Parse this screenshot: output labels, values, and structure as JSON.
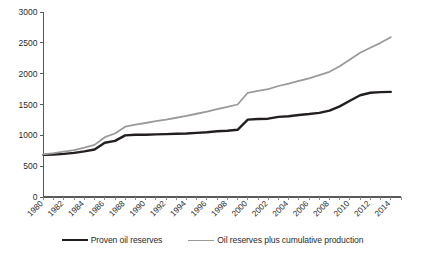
{
  "chart_data": {
    "type": "line",
    "title": "",
    "xlabel": "",
    "ylabel": "",
    "xlim": [
      1980,
      2015
    ],
    "ylim": [
      0,
      3000
    ],
    "grid": false,
    "legend_position": "bottom",
    "y_ticks": [
      0,
      500,
      1000,
      1500,
      2000,
      2500,
      3000
    ],
    "x_ticks": [
      1980,
      1982,
      1984,
      1986,
      1988,
      1990,
      1992,
      1994,
      1996,
      1998,
      2000,
      2002,
      2004,
      2006,
      2008,
      2010,
      2012,
      2014
    ],
    "x": [
      1980,
      1981,
      1982,
      1983,
      1984,
      1985,
      1986,
      1987,
      1988,
      1989,
      1990,
      1991,
      1992,
      1993,
      1994,
      1995,
      1996,
      1997,
      1998,
      1999,
      2000,
      2001,
      2002,
      2003,
      2004,
      2005,
      2006,
      2007,
      2008,
      2009,
      2010,
      2011,
      2012,
      2013,
      2014
    ],
    "series": [
      {
        "name": "Proven oil reserves",
        "color": "#231f20",
        "width": 2.4,
        "values": [
          683,
          690,
          700,
          715,
          740,
          770,
          880,
          910,
          1000,
          1010,
          1010,
          1015,
          1020,
          1025,
          1030,
          1040,
          1050,
          1065,
          1075,
          1090,
          1255,
          1265,
          1270,
          1300,
          1310,
          1330,
          1345,
          1365,
          1400,
          1470,
          1560,
          1650,
          1690,
          1700,
          1705
        ]
      },
      {
        "name": "Oil reserves plus cumulative production",
        "color": "#9a9a9a",
        "width": 1.8,
        "values": [
          690,
          710,
          735,
          760,
          800,
          845,
          970,
          1030,
          1140,
          1175,
          1200,
          1230,
          1255,
          1285,
          1315,
          1350,
          1385,
          1425,
          1460,
          1500,
          1690,
          1720,
          1750,
          1800,
          1840,
          1885,
          1925,
          1975,
          2030,
          2120,
          2230,
          2340,
          2420,
          2500,
          2590
        ]
      }
    ]
  },
  "legend": {
    "entries": [
      {
        "label": "Proven oil reserves"
      },
      {
        "label": "Oil reserves plus cumulative production"
      }
    ]
  }
}
